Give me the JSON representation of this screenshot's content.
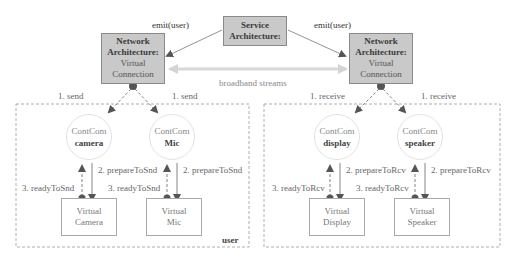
{
  "service": {
    "line1": "Service",
    "line2": "Architecture:"
  },
  "network_left": {
    "line1": "Network",
    "line2": "Architecture:",
    "line3": "Virtual",
    "line4": "Connection"
  },
  "network_right": {
    "line1": "Network",
    "line2": "Architecture:",
    "line3": "Virtual",
    "line4": "Connection"
  },
  "edges": {
    "emit_left": "emit(user)",
    "emit_right": "emit(user)",
    "broadband": "broadband streams"
  },
  "sender": {
    "domain_label": "user",
    "send_left": "1. send",
    "send_right": "1. send",
    "components": [
      {
        "type": "ContCom",
        "name": "camera",
        "prepare": "2. prepareToSnd",
        "ready": "3. readyToSnd",
        "virtual_line1": "Virtual",
        "virtual_line2": "Camera"
      },
      {
        "type": "ContCom",
        "name": "Mic",
        "prepare": "2. prepareToSnd",
        "ready": "3. readyToSnd",
        "virtual_line1": "Virtual",
        "virtual_line2": "Mic"
      }
    ]
  },
  "receiver": {
    "receive_left": "1. receive",
    "receive_right": "1. receive",
    "components": [
      {
        "type": "ContCom",
        "name": "display",
        "prepare": "2. prepareToRcv",
        "ready": "3. readyToRcv",
        "virtual_line1": "Virtual",
        "virtual_line2": "Display"
      },
      {
        "type": "ContCom",
        "name": "speaker",
        "prepare": "2. prepareToRcv",
        "ready": "3. readyToRcv",
        "virtual_line1": "Virtual",
        "virtual_line2": "Speaker"
      }
    ]
  },
  "colors": {
    "box_fill": "#c9c9c9",
    "box_border": "#8a8a8a",
    "arrow": "#555555",
    "broadband": "#d8d8d8",
    "dash": "#999999"
  }
}
